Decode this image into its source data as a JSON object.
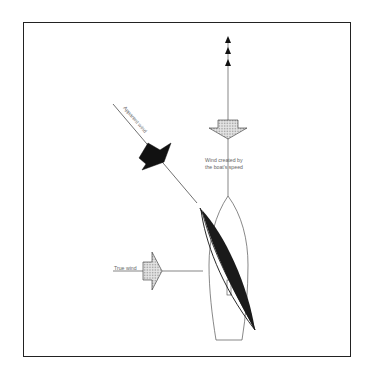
{
  "diagram": {
    "type": "sailing-apparent-wind",
    "labels": {
      "apparent_wind": "Apparent wind",
      "boat_speed_wind_line1": "Wind created by",
      "boat_speed_wind_line2": "the boat's speed",
      "true_wind": "True wind"
    },
    "colors": {
      "frame": "#222222",
      "line": "#333333",
      "apparent_arrow_fill": "#111111",
      "hatched_arrow_fill": "#d8d8d8",
      "sail_fill": "#1a1a1a",
      "label_text": "#666666"
    },
    "elements": [
      {
        "name": "course-arrows",
        "count": 3,
        "direction": "up"
      },
      {
        "name": "boat-speed-wind-arrow",
        "direction": "down",
        "style": "hatched"
      },
      {
        "name": "apparent-wind-arrow",
        "direction": "down-right",
        "style": "solid-black"
      },
      {
        "name": "true-wind-arrow",
        "direction": "right",
        "style": "hatched"
      },
      {
        "name": "boat-hull",
        "view": "top-down"
      },
      {
        "name": "sail",
        "style": "solid-black"
      }
    ]
  }
}
